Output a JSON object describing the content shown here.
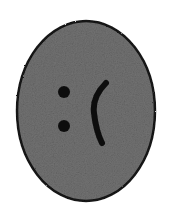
{
  "canvas": {
    "width": 170,
    "height": 216,
    "background_color": "#ffffff",
    "title": "Sad face drawing"
  },
  "figure": {
    "name": "sad-face",
    "emoticon_text": ":(",
    "face": {
      "shape": "ellipse",
      "center_x": 86,
      "center_y": 111,
      "radius_x": 69,
      "radius_y": 90,
      "fill_color": "#727272",
      "outline_color": "#151515",
      "outline_width": 2.5,
      "texture": "grainy-noise"
    },
    "eyes": [
      {
        "name": "upper-dot",
        "center_x": 64,
        "center_y": 92,
        "radius": 6,
        "color": "#0d0d0d"
      },
      {
        "name": "lower-dot",
        "center_x": 64,
        "center_y": 126,
        "radius": 6,
        "color": "#0d0d0d"
      }
    ],
    "mouth": {
      "name": "frown-arc",
      "shape": "open-curve",
      "color": "#0b0b0b",
      "stroke_width": 6,
      "start_x": 106,
      "start_y": 83,
      "control_x": 94,
      "control_y": 113,
      "end_x": 102,
      "end_y": 143
    }
  }
}
